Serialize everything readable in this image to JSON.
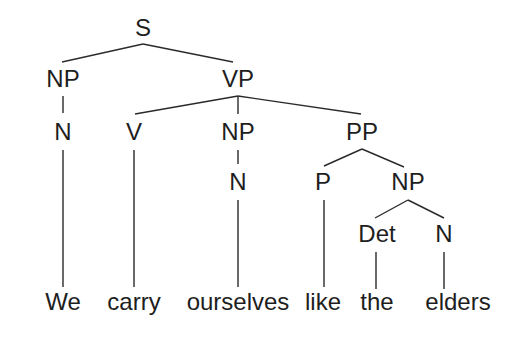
{
  "diagram": {
    "type": "syntax-tree",
    "sentence": "We carry ourselves like the elders",
    "nodes": {
      "s": {
        "label": "S",
        "x": 143,
        "y": 28
      },
      "np_subj": {
        "label": "NP",
        "x": 63,
        "y": 79
      },
      "vp": {
        "label": "VP",
        "x": 238,
        "y": 79
      },
      "n_subj": {
        "label": "N",
        "x": 63,
        "y": 132
      },
      "v": {
        "label": "V",
        "x": 134,
        "y": 132
      },
      "np_obj": {
        "label": "NP",
        "x": 238,
        "y": 132
      },
      "pp": {
        "label": "PP",
        "x": 362,
        "y": 132
      },
      "n_obj": {
        "label": "N",
        "x": 238,
        "y": 182
      },
      "p": {
        "label": "P",
        "x": 323,
        "y": 182
      },
      "np_pp": {
        "label": "NP",
        "x": 408,
        "y": 182
      },
      "det": {
        "label": "Det",
        "x": 377,
        "y": 234
      },
      "n_pp": {
        "label": "N",
        "x": 444,
        "y": 234
      }
    },
    "words": [
      {
        "text": "We",
        "x": 63,
        "y": 302
      },
      {
        "text": "carry",
        "x": 134,
        "y": 302
      },
      {
        "text": "ourselves",
        "x": 238,
        "y": 302
      },
      {
        "text": "like",
        "x": 323,
        "y": 302
      },
      {
        "text": "the",
        "x": 377,
        "y": 302
      },
      {
        "text": "elders",
        "x": 458,
        "y": 302
      }
    ],
    "edges": [
      {
        "x1": 143,
        "y1": 44,
        "x2": 62,
        "y2": 62
      },
      {
        "x1": 143,
        "y1": 44,
        "x2": 233,
        "y2": 62
      },
      {
        "x1": 63,
        "y1": 96,
        "x2": 63,
        "y2": 113
      },
      {
        "x1": 238,
        "y1": 96,
        "x2": 135,
        "y2": 114
      },
      {
        "x1": 238,
        "y1": 96,
        "x2": 238,
        "y2": 114
      },
      {
        "x1": 238,
        "y1": 96,
        "x2": 361,
        "y2": 114
      },
      {
        "x1": 63,
        "y1": 150,
        "x2": 63,
        "y2": 287
      },
      {
        "x1": 134,
        "y1": 150,
        "x2": 134,
        "y2": 287
      },
      {
        "x1": 238,
        "y1": 150,
        "x2": 238,
        "y2": 164
      },
      {
        "x1": 362,
        "y1": 149,
        "x2": 324,
        "y2": 166
      },
      {
        "x1": 362,
        "y1": 149,
        "x2": 404,
        "y2": 167
      },
      {
        "x1": 238,
        "y1": 200,
        "x2": 238,
        "y2": 287
      },
      {
        "x1": 324,
        "y1": 200,
        "x2": 324,
        "y2": 287
      },
      {
        "x1": 408,
        "y1": 200,
        "x2": 375,
        "y2": 218
      },
      {
        "x1": 408,
        "y1": 200,
        "x2": 444,
        "y2": 218
      },
      {
        "x1": 376,
        "y1": 252,
        "x2": 376,
        "y2": 289
      },
      {
        "x1": 444,
        "y1": 252,
        "x2": 444,
        "y2": 289
      }
    ],
    "colors": {
      "text": "#1e1e1e",
      "line": "#2a2a2a",
      "background": "#ffffff"
    }
  }
}
